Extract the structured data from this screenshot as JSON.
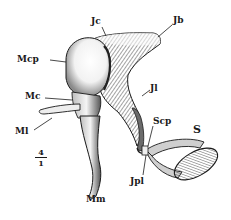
{
  "figure": {
    "labels": {
      "jc": "Jc",
      "jb": "Jb",
      "mcp": "Mcp",
      "mc": "Mc",
      "jl": "Jl",
      "ml": "Ml",
      "scp": "Scp",
      "s": "S",
      "jpl": "Jpl",
      "mm": "Mm"
    },
    "scale": {
      "numerator": "4",
      "denominator": "1"
    },
    "colors": {
      "ink": "#1a1a1a",
      "paper": "#ffffff",
      "shade": "#6b6b6b"
    }
  }
}
